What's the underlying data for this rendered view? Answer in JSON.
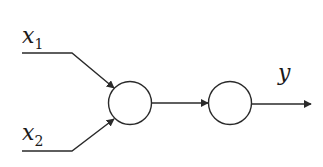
{
  "diagram": {
    "type": "neural-network",
    "inputs": [
      {
        "id": "x1",
        "symbol": "x",
        "subscript": "1"
      },
      {
        "id": "x2",
        "symbol": "x",
        "subscript": "2"
      }
    ],
    "nodes": [
      {
        "id": "hidden-neuron"
      },
      {
        "id": "output-neuron"
      }
    ],
    "output": {
      "id": "y",
      "symbol": "y"
    },
    "edges": [
      {
        "from": "x1",
        "to": "hidden-neuron"
      },
      {
        "from": "x2",
        "to": "hidden-neuron"
      },
      {
        "from": "hidden-neuron",
        "to": "output-neuron"
      },
      {
        "from": "output-neuron",
        "to": "y"
      }
    ],
    "colors": {
      "stroke": "#2a2a2a",
      "background": "#ffffff"
    }
  }
}
